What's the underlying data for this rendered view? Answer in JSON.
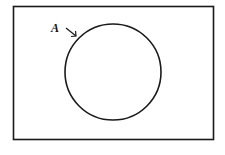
{
  "diagram": {
    "type": "venn",
    "universal_set": {
      "label": ""
    },
    "sets": [
      {
        "label": "A",
        "shape": "circle"
      }
    ],
    "colors": {
      "stroke": "#1a1a1a",
      "background": "#ffffff"
    }
  }
}
